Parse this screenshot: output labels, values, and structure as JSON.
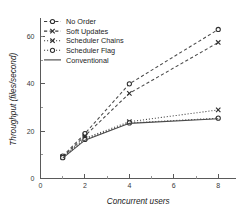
{
  "chart_data": {
    "type": "line",
    "title": "",
    "xlabel": "Concurrent users",
    "ylabel": "Throughput (files/second)",
    "xlim": [
      0,
      8.8
    ],
    "ylim": [
      0,
      67
    ],
    "xticks": [
      0,
      2,
      4,
      6,
      8
    ],
    "yticks": [
      0,
      20,
      40,
      60
    ],
    "xtick_labels": [
      "0",
      "2",
      "4",
      "6",
      "8"
    ],
    "ytick_labels": [
      "0",
      "20",
      "40",
      "60"
    ],
    "grid": false,
    "legend_position": "upper-left",
    "x": [
      1,
      2,
      4,
      8
    ],
    "series": [
      {
        "name": "No Order",
        "marker": "circle",
        "linestyle": "dashed",
        "values": [
          9.5,
          19.0,
          40.0,
          63.0
        ]
      },
      {
        "name": "Soft Updates",
        "marker": "x",
        "linestyle": "dashed",
        "values": [
          9.0,
          18.0,
          36.0,
          57.5
        ]
      },
      {
        "name": "Scheduler Chains",
        "marker": "x",
        "linestyle": "dotted",
        "values": [
          9.2,
          17.0,
          24.0,
          29.0
        ]
      },
      {
        "name": "Scheduler Flag",
        "marker": "circle",
        "linestyle": "dotted",
        "values": [
          8.8,
          16.5,
          23.5,
          25.5
        ]
      },
      {
        "name": "Conventional",
        "marker": "none",
        "linestyle": "solid",
        "values": [
          8.6,
          16.2,
          23.3,
          25.3
        ]
      }
    ]
  },
  "legend": {
    "entries": [
      {
        "label": "No Order"
      },
      {
        "label": "Soft Updates"
      },
      {
        "label": "Scheduler Chains"
      },
      {
        "label": "Scheduler Flag"
      },
      {
        "label": "Conventional"
      }
    ]
  },
  "axes": {
    "x_title": "Concurrent users",
    "y_title": "Throughput (files/second)"
  },
  "colors": {
    "ink": "#2f2f2f",
    "axis": "#5a5a5a",
    "background": "#ffffff"
  }
}
